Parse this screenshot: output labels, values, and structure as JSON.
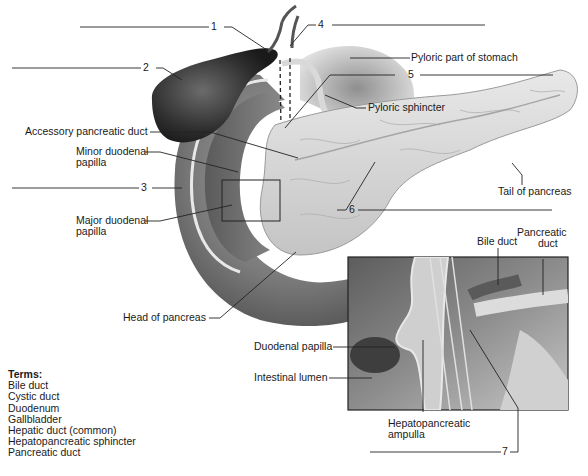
{
  "figure": {
    "numbered_blanks": [
      {
        "number": "1"
      },
      {
        "number": "2"
      },
      {
        "number": "3"
      },
      {
        "number": "4"
      },
      {
        "number": "5"
      },
      {
        "number": "6"
      },
      {
        "number": "7"
      }
    ],
    "labels": {
      "pyloric_part_of_stomach": "Pyloric part of stomach",
      "pyloric_sphincter": "Pyloric sphincter",
      "accessory_pancreatic_duct": "Accessory pancreatic duct",
      "minor_duodenal_papilla_line1": "Minor duodenal",
      "minor_duodenal_papilla_line2": "papilla",
      "major_duodenal_papilla_line1": "Major duodenal",
      "major_duodenal_papilla_line2": "papilla",
      "tail_of_pancreas": "Tail of pancreas",
      "head_of_pancreas": "Head of pancreas",
      "bile_duct": "Bile duct",
      "pancreatic_duct_line1": "Pancreatic",
      "pancreatic_duct_line2": "duct",
      "duodenal_papilla": "Duodenal papilla",
      "intestinal_lumen": "Intestinal lumen",
      "hepatopancreatic_ampulla_line1": "Hepatopancreatic",
      "hepatopancreatic_ampulla_line2": "ampulla"
    }
  },
  "terms": {
    "title": "Terms:",
    "items": [
      "Bile duct",
      "Cystic duct",
      "Duodenum",
      "Gallbladder",
      "Hepatic duct (common)",
      "Hepatopancreatic sphincter",
      "Pancreatic duct"
    ]
  },
  "colors": {
    "line": "#222222",
    "gallbladder": "#3a3a3a",
    "duodenum": "#7a7a7a",
    "pancreas": "#d8d8d8",
    "inset_bg": "#6e6e6e"
  }
}
